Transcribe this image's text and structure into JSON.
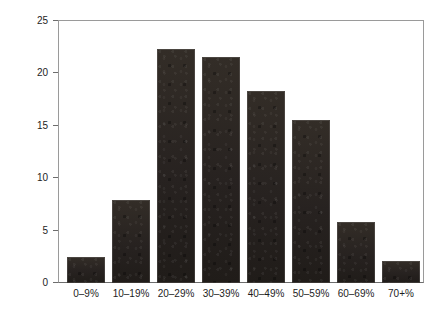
{
  "chart_data": {
    "type": "bar",
    "title": "",
    "xlabel": "",
    "ylabel": "Percent of respondents",
    "categories": [
      "0–9%",
      "10–19%",
      "20–29%",
      "30–39%",
      "40–49%",
      "50–59%",
      "60–69%",
      "70+%"
    ],
    "values": [
      2.5,
      7.9,
      22.3,
      21.6,
      18.3,
      15.6,
      5.8,
      2.1
    ],
    "ylim": [
      0,
      25
    ],
    "yticks": [
      0,
      5,
      10,
      15,
      20,
      25
    ],
    "ytick_labels": [
      "0",
      "5",
      "10",
      "15",
      "20",
      "25"
    ],
    "grid": false,
    "legend": null,
    "legend_position": "none",
    "bar_color": "#2a2520",
    "axis_color": "#6d6d6d",
    "frame": {
      "top": true,
      "right": true,
      "left": true,
      "bottom": true
    },
    "annotations": []
  }
}
